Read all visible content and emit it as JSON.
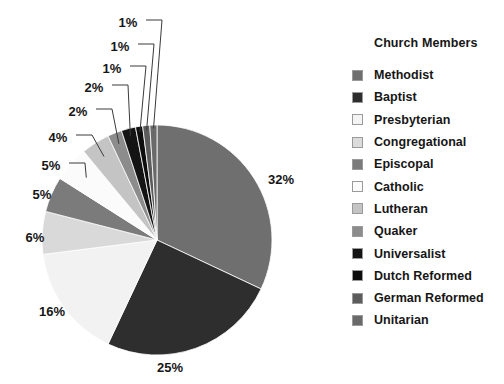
{
  "chart_data": {
    "type": "pie",
    "title": "Church Members",
    "legend_position": "right",
    "grid": false,
    "value_suffix": "%",
    "start_angle_deg": 0,
    "direction": "clockwise",
    "categories": [
      "Methodist",
      "Baptist",
      "Presbyterian",
      "Congregational",
      "Episcopal",
      "Catholic",
      "Lutheran",
      "Quaker",
      "Universalist",
      "Dutch Reformed",
      "German Reformed",
      "Unitarian"
    ],
    "values": [
      32,
      25,
      16,
      6,
      5,
      5,
      4,
      2,
      2,
      1,
      1,
      1
    ],
    "labels": [
      "32%",
      "25%",
      "16%",
      "6%",
      "5%",
      "5%",
      "4%",
      "2%",
      "2%",
      "1%",
      "1%",
      "1%"
    ],
    "colors": [
      "#6f6f6f",
      "#2e2e2e",
      "#f2f2f2",
      "#d9d9d9",
      "#7b7b7b",
      "#fbfbfb",
      "#c4c4c4",
      "#8c8c8c",
      "#141414",
      "#0d0d0d",
      "#5c5c5c",
      "#6a6a6a"
    ],
    "slices": [
      {
        "name": "Methodist",
        "value": 32,
        "label": "32%",
        "color": "#6f6f6f"
      },
      {
        "name": "Baptist",
        "value": 25,
        "label": "25%",
        "color": "#2e2e2e"
      },
      {
        "name": "Presbyterian",
        "value": 16,
        "label": "16%",
        "color": "#f2f2f2"
      },
      {
        "name": "Congregational",
        "value": 6,
        "label": "6%",
        "color": "#d9d9d9"
      },
      {
        "name": "Episcopal",
        "value": 5,
        "label": "5%",
        "color": "#7b7b7b"
      },
      {
        "name": "Catholic",
        "value": 5,
        "label": "5%",
        "color": "#fbfbfb"
      },
      {
        "name": "Lutheran",
        "value": 4,
        "label": "4%",
        "color": "#c4c4c4"
      },
      {
        "name": "Quaker",
        "value": 2,
        "label": "2%",
        "color": "#8c8c8c"
      },
      {
        "name": "Universalist",
        "value": 2,
        "label": "2%",
        "color": "#141414"
      },
      {
        "name": "Dutch Reformed",
        "value": 1,
        "label": "1%",
        "color": "#0d0d0d"
      },
      {
        "name": "German Reformed",
        "value": 1,
        "label": "1%",
        "color": "#5c5c5c"
      },
      {
        "name": "Unitarian",
        "value": 1,
        "label": "1%",
        "color": "#6a6a6a"
      }
    ]
  },
  "legend": {
    "title": "Church Members",
    "items": [
      {
        "label": "Methodist",
        "color": "#6f6f6f"
      },
      {
        "label": "Baptist",
        "color": "#2e2e2e"
      },
      {
        "label": "Presbyterian",
        "color": "#f4f4f4"
      },
      {
        "label": "Congregational",
        "color": "#dcdcdc"
      },
      {
        "label": "Episcopal",
        "color": "#7b7b7b"
      },
      {
        "label": "Catholic",
        "color": "#fbfbfb"
      },
      {
        "label": "Lutheran",
        "color": "#c4c4c4"
      },
      {
        "label": "Quaker",
        "color": "#8c8c8c"
      },
      {
        "label": "Universalist",
        "color": "#141414"
      },
      {
        "label": "Dutch Reformed",
        "color": "#0d0d0d"
      },
      {
        "label": "German Reformed",
        "color": "#5c5c5c"
      },
      {
        "label": "Unitarian",
        "color": "#6a6a6a"
      }
    ]
  },
  "geometry": {
    "center_x": 157,
    "center_y": 240,
    "radius": 115
  }
}
